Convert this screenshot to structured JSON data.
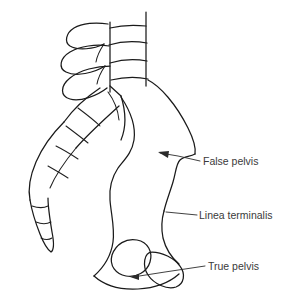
{
  "figure": {
    "background_color": "#ffffff",
    "line_color": "#1a1a1a",
    "label_color": "#3a3a3a",
    "width": 286,
    "height": 307
  },
  "labels": [
    {
      "id": "false-pelvis",
      "text": "False pelvis",
      "text_x": 203,
      "text_y": 162,
      "leader": "M 200 161 L 178 156 L 160 153",
      "arrow_tip_x": 158,
      "arrow_tip_y": 152
    },
    {
      "id": "linea-terminalis",
      "text": "Linea terminalis",
      "text_x": 199,
      "text_y": 216,
      "leader": "M 197 215 L 166 212",
      "arrow_tip_x": 164,
      "arrow_tip_y": 212
    },
    {
      "id": "true-pelvis",
      "text": "True pelvis",
      "text_x": 208,
      "text_y": 267,
      "leader": "M 205 266 L 165 272 L 133 277",
      "arrow_tip_x": 130,
      "arrow_tip_y": 277
    }
  ],
  "structures": {
    "lumbar_vertebrae": "Lumbar vertebral bodies with intervertebral discs",
    "spinous_processes": "Posterior spinous processes",
    "sacrum": "Sacrum with transverse segment lines",
    "coccyx": "Coccyx tapering inferiorly",
    "ilium": "Iliac wing forming the false pelvis",
    "obturator_foramen": "Obturator foramen",
    "ischium": "Ischial and pubic rami forming the true pelvis"
  },
  "paths": {
    "vertebral_body_right_edge": "M 146 12 L 146 86",
    "vertebral_body_left_edge": "M 110 22 L 110 92",
    "disc_line_1": "M 110 28 C 122 25 136 25 146 26",
    "disc_line_2": "M 109 45 C 122 41 136 41 147 43",
    "disc_line_3": "M 110 63 C 123 59 137 59 147 61",
    "disc_line_4": "M 111 80 C 124 77 138 77 148 79",
    "sacral_promontory": "M 110 86 L 121 96",
    "sacrum_anterior": "M 121 96 C 126 112 126 128 121 140",
    "iliac_crest": "M 148 80 C 160 86 176 104 188 128 C 194 140 196 148 195 154",
    "ilium_lateral_notch": "M 195 154 C 190 157 184 156 180 160 C 176 164 176 172 173 182 C 170 192 166 202 164 211",
    "ilium_anterior_inferior": "M 164 211 C 162 218 161 228 163 238 C 166 250 172 258 179 264",
    "ilium_medial_border": "M 121 97 C 131 112 136 126 134 140 C 132 153 124 160 118 168 C 112 177 109 188 110 200 C 111 214 115 228 113 242 C 111 256 103 268 94 276",
    "ischiopubic_outline": "M 94 276 C 104 285 120 290 138 289 C 156 288 170 282 179 274",
    "obturator_foramen": "M 112 255 C 116 244 126 238 137 240 C 148 242 153 252 150 262 C 147 272 136 278 126 276 C 116 274 109 266 112 255 Z",
    "ischial_tuberosity": "M 152 252 C 162 252 174 258 180 266 C 186 274 184 284 176 287 C 167 290 154 284 148 275 C 142 266 144 252 152 252 Z",
    "spinous_1": "M 108 24 C 96 22 82 23 74 28 C 66 33 64 42 70 46 C 78 51 94 49 104 44",
    "spinous_2": "M 109 46 C 96 44 80 46 70 52 C 60 58 58 68 66 72 C 76 77 94 73 105 66",
    "spinous_3": "M 110 66 C 97 66 80 70 70 78 C 60 86 60 96 70 99 C 80 102 97 96 107 88",
    "lamina_1": "M 104 44 C 100 50 97 56 96 62",
    "lamina_2": "M 105 66 C 101 72 98 78 97 84",
    "sacral_wing_upper": "M 100 88 C 88 96 74 108 64 122",
    "sacral_wing_lower": "M 119 106 C 106 118 90 132 76 148",
    "sacral_seg_1": "M 78 108 C 86 114 94 120 100 126",
    "sacral_seg_2": "M 66 126 C 74 132 82 138 88 143",
    "sacral_seg_3": "M 56 146 C 64 150 72 155 78 159",
    "sacral_seg_4": "M 48 166 C 55 170 62 174 68 178",
    "sacrum_posterior": "M 64 122 C 52 134 42 148 36 162 C 30 176 28 190 30 200",
    "coccyx_outline": "M 30 200 C 32 212 36 224 40 234 C 44 244 48 250 51 252 C 54 250 54 242 52 232 C 50 220 48 208 48 198",
    "coccyx_seg_1": "M 32 206 C 38 208 44 208 48 206",
    "coccyx_seg_2": "M 36 222 C 41 224 47 224 51 222",
    "coccyx_seg_3": "M 41 238 C 45 240 49 240 52 238",
    "sacrum_medial_inner": "M 76 148 C 66 160 56 174 50 188",
    "ala_detail": "M 108 92 C 114 100 118 110 119 120"
  }
}
